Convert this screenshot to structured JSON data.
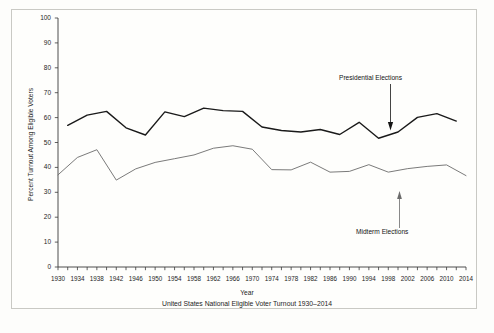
{
  "chart_data": {
    "type": "line",
    "title": "",
    "caption": "United States National Eligible Voter Turnout 1930–2014",
    "xlabel": "Year",
    "ylabel": "Percent Turnout Among Eligible Voters",
    "ylim": [
      0,
      100
    ],
    "xlim": [
      1930,
      2014
    ],
    "ytick_labels": [
      "0",
      "10",
      "20",
      "30",
      "40",
      "50",
      "60",
      "70",
      "80",
      "90",
      "100"
    ],
    "ytick_values": [
      0,
      10,
      20,
      30,
      40,
      50,
      60,
      70,
      80,
      90,
      100
    ],
    "xtick_labels": [
      "1930",
      "1934",
      "1938",
      "1942",
      "1946",
      "1950",
      "1954",
      "1958",
      "1962",
      "1966",
      "1970",
      "1974",
      "1978",
      "1982",
      "1986",
      "1990",
      "1994",
      "1998",
      "2002",
      "2006",
      "2010",
      "2014"
    ],
    "xtick_values": [
      1930,
      1934,
      1938,
      1942,
      1946,
      1950,
      1954,
      1958,
      1962,
      1966,
      1970,
      1974,
      1978,
      1982,
      1986,
      1990,
      1994,
      1998,
      2002,
      2006,
      2010,
      2014
    ],
    "minor_tick_interval": 2,
    "grid": false,
    "legend_position": "annotations-inline",
    "series": [
      {
        "name": "Presidential Elections",
        "color": "#1a1a1a",
        "linewidth": 1.4,
        "x": [
          1932,
          1936,
          1940,
          1944,
          1948,
          1952,
          1956,
          1960,
          1964,
          1968,
          1972,
          1976,
          1980,
          1984,
          1988,
          1992,
          1996,
          2000,
          2004,
          2008,
          2012
        ],
        "values": [
          56.9,
          61.0,
          62.5,
          55.9,
          53.0,
          62.3,
          60.4,
          63.8,
          62.8,
          62.5,
          56.2,
          54.8,
          54.2,
          55.2,
          53.2,
          58.1,
          51.7,
          54.2,
          60.1,
          61.6,
          58.6
        ]
      },
      {
        "name": "Midterm Elections",
        "color": "#6b6b6b",
        "linewidth": 0.9,
        "x": [
          1930,
          1934,
          1938,
          1942,
          1946,
          1950,
          1954,
          1958,
          1962,
          1966,
          1970,
          1974,
          1978,
          1982,
          1986,
          1990,
          1994,
          1998,
          2002,
          2006,
          2010,
          2014
        ],
        "values": [
          37.0,
          44.0,
          47.1,
          34.9,
          39.4,
          42.0,
          43.5,
          45.0,
          47.7,
          48.7,
          47.3,
          39.1,
          39.0,
          42.1,
          38.1,
          38.4,
          41.1,
          38.1,
          39.5,
          40.4,
          41.0,
          36.7
        ]
      }
    ],
    "annotations": [
      {
        "text": "Presidential Elections",
        "target_year": 1998,
        "target_value": 54
      },
      {
        "text": "Midterm Elections",
        "target_year": 1998,
        "target_value": 38
      }
    ]
  },
  "figure": {
    "background": "#fdfdfb",
    "frame_color": "#c9c9c4",
    "axis_color": "#3a3a3a"
  }
}
